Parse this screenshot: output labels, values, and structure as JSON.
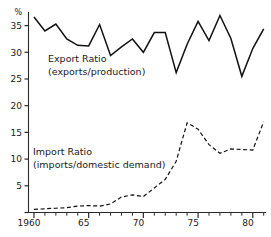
{
  "chart_data": {
    "type": "line",
    "title": "",
    "xlabel": "",
    "ylabel": "",
    "y_unit": "%",
    "xlim": [
      1959.5,
      1981.5
    ],
    "ylim": [
      0,
      37.5
    ],
    "grid": false,
    "legend_position": "inline-annotation",
    "x_tick_labels": [
      "1960",
      "65",
      "70",
      "75",
      "80"
    ],
    "x_tick_values": [
      1960,
      1965,
      1970,
      1975,
      1980
    ],
    "x_minor_step": 1,
    "y_tick_labels": [
      "5",
      "10",
      "15",
      "20",
      "25",
      "30",
      "35"
    ],
    "y_tick_values": [
      5,
      10,
      15,
      20,
      25,
      30,
      35
    ],
    "x": [
      1960,
      1961,
      1962,
      1963,
      1964,
      1965,
      1966,
      1967,
      1968,
      1969,
      1970,
      1971,
      1972,
      1973,
      1974,
      1975,
      1976,
      1977,
      1978,
      1979,
      1980,
      1981
    ],
    "series": [
      {
        "name": "Export Ratio",
        "definition": "(exports/production)",
        "style": "solid",
        "values": [
          36.6,
          34.0,
          35.3,
          32.5,
          31.3,
          31.2,
          35.2,
          29.4,
          31.0,
          32.5,
          30.0,
          33.7,
          33.7,
          26.2,
          31.5,
          35.8,
          32.2,
          36.9,
          32.6,
          25.5,
          30.7,
          34.4
        ]
      },
      {
        "name": "Import Ratio",
        "definition": "(imports/domestic demand)",
        "style": "dashed",
        "values": [
          0.6,
          0.7,
          0.8,
          0.9,
          1.2,
          1.3,
          1.2,
          1.6,
          2.9,
          3.3,
          3.0,
          4.6,
          6.2,
          9.6,
          16.8,
          15.6,
          12.7,
          11.1,
          11.9,
          11.8,
          11.7,
          17.0
        ]
      }
    ],
    "annotations": [
      {
        "name": "export-ratio-label",
        "line1": "Export Ratio",
        "line2": "(exports/production)",
        "x_px": 48,
        "y_px": 62
      },
      {
        "name": "import-ratio-label",
        "line1": "Import Ratio",
        "line2": "(imports/domestic demand)",
        "x_px": 33,
        "y_px": 155
      }
    ],
    "colors": {
      "line": "#111111",
      "axis": "#2a2a2a",
      "background": "#ffffff"
    }
  }
}
